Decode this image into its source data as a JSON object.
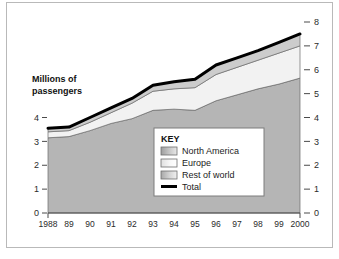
{
  "figure": {
    "border_color": "#b9b9b9",
    "background": "#ffffff"
  },
  "axis": {
    "y_title_line1": "Millions of",
    "y_title_line2": "passengers",
    "left_ticks": [
      "4",
      "3",
      "2",
      "1",
      "0"
    ],
    "right_ticks": [
      "8",
      "7",
      "6",
      "5",
      "4",
      "3",
      "2",
      "1",
      "0"
    ],
    "x_ticks": [
      "1988",
      "89",
      "90",
      "91",
      "92",
      "93",
      "94",
      "95",
      "96",
      "97",
      "98",
      "99",
      "2000"
    ]
  },
  "legend": {
    "title": "KEY",
    "items": [
      {
        "label": "North America",
        "swatch": "#b5b5b5",
        "type": "area"
      },
      {
        "label": "Europe",
        "swatch": "#f2f2f2",
        "type": "area"
      },
      {
        "label": "Rest of world",
        "swatch": "#cccccc",
        "type": "area"
      },
      {
        "label": "Total",
        "swatch": "#000000",
        "type": "line"
      }
    ]
  },
  "chart_data": {
    "type": "area",
    "title": "",
    "subtitle": "",
    "xlabel": "",
    "ylabel": "Millions of passengers",
    "stacked": true,
    "grid": false,
    "legend_position": "inside-bottom-right",
    "xlim": [
      1988,
      2000
    ],
    "ylim": [
      0,
      8
    ],
    "x": [
      1988,
      1989,
      1990,
      1991,
      1992,
      1993,
      1994,
      1995,
      1996,
      1997,
      1998,
      1999,
      2000
    ],
    "categories": [
      "1988",
      "89",
      "90",
      "91",
      "92",
      "93",
      "94",
      "95",
      "96",
      "97",
      "98",
      "99",
      "2000"
    ],
    "series": [
      {
        "name": "North America",
        "color": "#b5b5b5",
        "values": [
          3.15,
          3.2,
          3.45,
          3.75,
          3.95,
          4.3,
          4.35,
          4.3,
          4.7,
          4.95,
          5.2,
          5.4,
          5.65
        ]
      },
      {
        "name": "Europe",
        "color": "#f2f2f2",
        "values": [
          0.25,
          0.25,
          0.35,
          0.45,
          0.65,
          0.8,
          0.85,
          0.95,
          1.1,
          1.15,
          1.2,
          1.3,
          1.35
        ]
      },
      {
        "name": "Rest of world",
        "color": "#cccccc",
        "values": [
          0.15,
          0.15,
          0.2,
          0.2,
          0.2,
          0.25,
          0.3,
          0.35,
          0.4,
          0.4,
          0.4,
          0.45,
          0.5
        ]
      }
    ],
    "cumulative": {
      "north_america_top": [
        3.15,
        3.2,
        3.45,
        3.75,
        3.95,
        4.3,
        4.35,
        4.3,
        4.7,
        4.95,
        5.2,
        5.4,
        5.65
      ],
      "europe_top": [
        3.4,
        3.45,
        3.8,
        4.2,
        4.6,
        5.1,
        5.2,
        5.25,
        5.8,
        6.1,
        6.4,
        6.7,
        7.0
      ],
      "total": [
        3.55,
        3.6,
        4.0,
        4.4,
        4.8,
        5.35,
        5.5,
        5.6,
        6.2,
        6.5,
        6.8,
        7.15,
        7.5
      ]
    },
    "total_line": {
      "name": "Total",
      "color": "#000000",
      "width": 3,
      "values": [
        3.55,
        3.6,
        4.0,
        4.4,
        4.8,
        5.35,
        5.5,
        5.6,
        6.2,
        6.5,
        6.8,
        7.15,
        7.5
      ]
    }
  }
}
